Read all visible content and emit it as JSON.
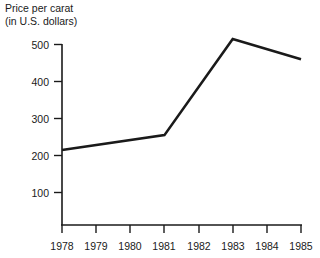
{
  "chart_data": {
    "type": "line",
    "title": "Price per carat (in U.S. dollars)",
    "title_line1": "Price per carat",
    "title_line2": "(in U.S. dollars)",
    "xlabel": "",
    "ylabel": "Price per carat (in U.S. dollars)",
    "categories": [
      "1978",
      "1979",
      "1980",
      "1981",
      "1982",
      "1983",
      "1984",
      "1985"
    ],
    "x": [
      1978,
      1979,
      1980,
      1981,
      1982,
      1983,
      1984,
      1985
    ],
    "values": [
      215,
      228,
      241,
      255,
      385,
      515,
      487,
      460
    ],
    "vertices": [
      {
        "year": "1978",
        "value": 215
      },
      {
        "year": "1981",
        "value": 255
      },
      {
        "year": "1983",
        "value": 515
      },
      {
        "year": "1985",
        "value": 460
      }
    ],
    "ylim": [
      0,
      540
    ],
    "xlim": [
      "1978",
      "1985"
    ],
    "y_ticks": [
      "100",
      "200",
      "300",
      "400",
      "500"
    ],
    "y_tick_values": [
      100,
      200,
      300,
      400,
      500
    ],
    "x_ticks": [
      "1978",
      "1979",
      "1980",
      "1981",
      "1982",
      "1983",
      "1984",
      "1985"
    ],
    "grid": false,
    "legend": false,
    "legend_position": "none",
    "line_color": "#1a1a1a",
    "axis_color": "#1a1a1a",
    "background_color": "#ffffff"
  }
}
